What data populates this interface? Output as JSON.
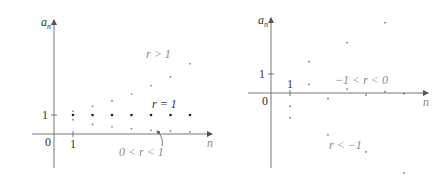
{
  "chart_data": [
    {
      "type": "scatter",
      "title": "",
      "xlabel": "n",
      "ylabel": "a_n",
      "x_ticks": [
        "1"
      ],
      "y_ticks": [
        "1"
      ],
      "origin_label": "0",
      "grid": false,
      "legend": "none",
      "series": [
        {
          "name": "r > 1",
          "label": "r > 1",
          "x": [
            1,
            2,
            3,
            4,
            5,
            6,
            7
          ],
          "values": [
            1.2,
            1.45,
            1.75,
            2.1,
            2.55,
            3.0,
            3.7
          ]
        },
        {
          "name": "r = 1",
          "label": "r = 1",
          "x": [
            1,
            2,
            3,
            4,
            5,
            6,
            7
          ],
          "values": [
            1,
            1,
            1,
            1,
            1,
            1,
            1
          ]
        },
        {
          "name": "0 < r < 1",
          "label": "0 < r < 1",
          "x": [
            1,
            2,
            3,
            4,
            5,
            6,
            7
          ],
          "values": [
            0.75,
            0.5,
            0.38,
            0.28,
            0.2,
            0.16,
            0.12
          ]
        }
      ],
      "annotations": [
        {
          "text": "r > 1",
          "position": "upper-right"
        },
        {
          "text": "r = 1",
          "position": "above r=1 row"
        },
        {
          "text": "0 < r < 1",
          "position": "below x-axis with arrow"
        }
      ]
    },
    {
      "type": "scatter",
      "title": "",
      "xlabel": "n",
      "ylabel": "a_n",
      "x_ticks": [
        "1"
      ],
      "y_ticks": [
        "1"
      ],
      "origin_label": "0",
      "grid": false,
      "legend": "none",
      "series": [
        {
          "name": "-1 < r < 0",
          "label": "−1 < r < 0",
          "x": [
            1,
            2,
            3,
            4,
            5,
            6,
            7
          ],
          "values": [
            -0.7,
            0.45,
            -0.3,
            0.2,
            -0.1,
            0.07,
            -0.04
          ]
        },
        {
          "name": "r < -1",
          "label": "r < −1",
          "x": [
            1,
            2,
            3,
            4,
            5,
            6,
            7
          ],
          "values": [
            -1.3,
            1.65,
            -2.2,
            2.65,
            -3.1,
            3.7,
            -4.2
          ]
        }
      ],
      "annotations": [
        {
          "text": "−1 < r < 0",
          "position": "above x-axis right"
        },
        {
          "text": "r < −1",
          "position": "lower middle"
        }
      ]
    }
  ],
  "left_chart": {
    "y_axis_label": "a",
    "y_axis_sub": "n",
    "x_axis_label": "n",
    "tick_x": "1",
    "tick_y": "1",
    "origin": "0",
    "label_r_gt_1": "r > 1",
    "label_r_eq_1": "r = 1",
    "label_r_0_1": "0 < r < 1"
  },
  "right_chart": {
    "y_axis_label": "a",
    "y_axis_sub": "n",
    "x_axis_label": "n",
    "tick_x": "1",
    "tick_y": "1",
    "origin": "0",
    "label_neg1_0": "−1 < r < 0",
    "label_lt_neg1": "r < −1"
  }
}
